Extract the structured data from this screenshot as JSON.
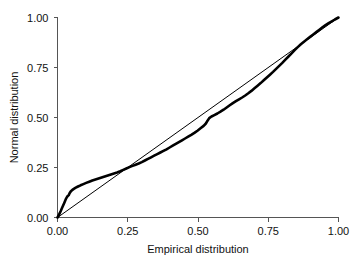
{
  "chart_data": {
    "type": "line",
    "title": "",
    "xlabel": "Empirical distribution",
    "ylabel": "Normal distribution",
    "xlim": [
      0.0,
      1.0
    ],
    "ylim": [
      0.0,
      1.0
    ],
    "grid": false,
    "legend": "none",
    "xticks": [
      "0.00",
      "0.25",
      "0.50",
      "0.75",
      "1.00"
    ],
    "xtick_values": [
      0.0,
      0.25,
      0.5,
      0.75,
      1.0
    ],
    "yticks": [
      "0.00",
      "0.25",
      "0.50",
      "0.75",
      "1.00"
    ],
    "ytick_values": [
      0.0,
      0.25,
      0.5,
      0.75,
      1.0
    ],
    "series": [
      {
        "name": "P-P curve",
        "style": "thick-black-line",
        "color": "#000000",
        "x": [
          0.0,
          0.004,
          0.008,
          0.012,
          0.016,
          0.02,
          0.024,
          0.028,
          0.031,
          0.034,
          0.036,
          0.038,
          0.04,
          0.043,
          0.047,
          0.052,
          0.058,
          0.065,
          0.073,
          0.082,
          0.092,
          0.102,
          0.113,
          0.124,
          0.135,
          0.146,
          0.157,
          0.168,
          0.179,
          0.19,
          0.201,
          0.212,
          0.223,
          0.234,
          0.245,
          0.256,
          0.267,
          0.278,
          0.289,
          0.3,
          0.311,
          0.322,
          0.333,
          0.344,
          0.355,
          0.366,
          0.377,
          0.388,
          0.399,
          0.41,
          0.421,
          0.432,
          0.443,
          0.454,
          0.465,
          0.476,
          0.487,
          0.498,
          0.509,
          0.52,
          0.528,
          0.534,
          0.54,
          0.548,
          0.558,
          0.569,
          0.58,
          0.591,
          0.602,
          0.613,
          0.624,
          0.635,
          0.646,
          0.657,
          0.668,
          0.679,
          0.69,
          0.701,
          0.712,
          0.723,
          0.734,
          0.745,
          0.756,
          0.767,
          0.778,
          0.789,
          0.8,
          0.811,
          0.822,
          0.833,
          0.844,
          0.855,
          0.866,
          0.877,
          0.888,
          0.899,
          0.91,
          0.921,
          0.932,
          0.943,
          0.954,
          0.965,
          0.976,
          0.987,
          1.0
        ],
        "y": [
          0.0,
          0.01,
          0.022,
          0.034,
          0.047,
          0.06,
          0.073,
          0.086,
          0.096,
          0.103,
          0.107,
          0.109,
          0.112,
          0.121,
          0.13,
          0.137,
          0.143,
          0.149,
          0.155,
          0.161,
          0.167,
          0.173,
          0.179,
          0.185,
          0.19,
          0.195,
          0.2,
          0.205,
          0.21,
          0.215,
          0.22,
          0.225,
          0.231,
          0.238,
          0.245,
          0.252,
          0.258,
          0.264,
          0.27,
          0.277,
          0.285,
          0.293,
          0.301,
          0.309,
          0.317,
          0.325,
          0.333,
          0.341,
          0.35,
          0.359,
          0.368,
          0.377,
          0.386,
          0.395,
          0.404,
          0.413,
          0.423,
          0.434,
          0.446,
          0.458,
          0.47,
          0.484,
          0.497,
          0.505,
          0.512,
          0.52,
          0.529,
          0.539,
          0.55,
          0.561,
          0.572,
          0.582,
          0.591,
          0.6,
          0.61,
          0.621,
          0.633,
          0.646,
          0.659,
          0.672,
          0.686,
          0.7,
          0.714,
          0.728,
          0.743,
          0.758,
          0.773,
          0.789,
          0.805,
          0.821,
          0.837,
          0.852,
          0.866,
          0.879,
          0.891,
          0.903,
          0.915,
          0.927,
          0.939,
          0.951,
          0.962,
          0.972,
          0.981,
          0.99,
          1.0
        ]
      },
      {
        "name": "Reference diagonal",
        "style": "thin-black-line",
        "color": "#000000",
        "x": [
          0.0,
          1.0
        ],
        "y": [
          0.0,
          1.0
        ]
      }
    ]
  },
  "axes": {
    "x_title": "Empirical distribution",
    "y_title": "Normal distribution"
  }
}
